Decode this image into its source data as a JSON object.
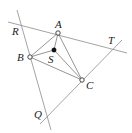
{
  "diagram": {
    "type": "geometry",
    "points": {
      "A": {
        "label": "A",
        "x": 58,
        "y": 33,
        "style": "open"
      },
      "B": {
        "label": "B",
        "x": 30,
        "y": 57,
        "style": "open"
      },
      "C": {
        "label": "C",
        "x": 82,
        "y": 80,
        "style": "open"
      },
      "S": {
        "label": "S",
        "x": 54,
        "y": 50,
        "style": "solid"
      }
    },
    "line_labels": {
      "R": {
        "label": "R",
        "x": 12,
        "y": 35
      },
      "T": {
        "label": "T",
        "x": 108,
        "y": 43
      },
      "Q": {
        "label": "Q",
        "x": 34,
        "y": 118
      }
    },
    "lines": [
      {
        "name": "line-through-A",
        "x1": 8,
        "y1": 22,
        "x2": 127,
        "y2": 53
      },
      {
        "name": "line-through-B",
        "x1": 17,
        "y1": 10,
        "x2": 51,
        "y2": 130
      },
      {
        "name": "line-through-C",
        "x1": 40,
        "y1": 124,
        "x2": 122,
        "y2": 40
      }
    ],
    "segments": [
      {
        "name": "segment-AB",
        "from": "A",
        "to": "B"
      },
      {
        "name": "segment-BC",
        "from": "B",
        "to": "C"
      },
      {
        "name": "segment-CA",
        "from": "C",
        "to": "A"
      },
      {
        "name": "segment-SA",
        "from": "S",
        "to": "A"
      },
      {
        "name": "segment-SB",
        "from": "S",
        "to": "B"
      },
      {
        "name": "segment-SC",
        "from": "S",
        "to": "C"
      }
    ]
  }
}
